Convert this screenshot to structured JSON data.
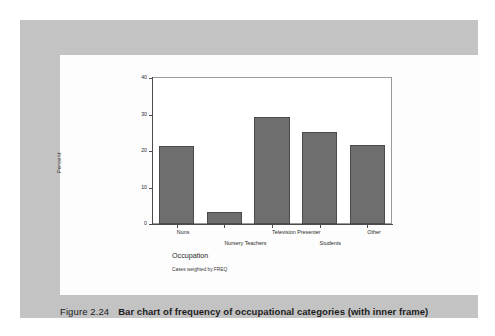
{
  "figure": {
    "number": "Figure 2.24",
    "caption": "Bar chart of frequency of occupational categories (with inner frame)"
  },
  "chart_data": {
    "type": "bar",
    "title": "",
    "categories": [
      "Nuns",
      "Nursery Teachers",
      "Television Presenter",
      "Students",
      "Other"
    ],
    "values": [
      21.3,
      3.4,
      29.2,
      25.3,
      21.6
    ],
    "xlabel": "Occupation",
    "ylabel": "Percent",
    "ylim": [
      0,
      40
    ],
    "yticks": [
      0,
      10,
      20,
      30,
      40
    ],
    "ytick_labels": [
      "0",
      "10",
      "20",
      "30",
      "40"
    ],
    "grid": false,
    "legend": "none",
    "footnote": "Cases weighted by FREQ",
    "bar_color": "#6e6e6e",
    "bar_edge_color": "#4a4a4a",
    "frame_color": "#9a9a9a",
    "axis_color": "#4c4c4c"
  },
  "page": {
    "band_color": "#c3c3c3",
    "panel_color": "#fdfdfd",
    "background_color": "#ffffff"
  }
}
